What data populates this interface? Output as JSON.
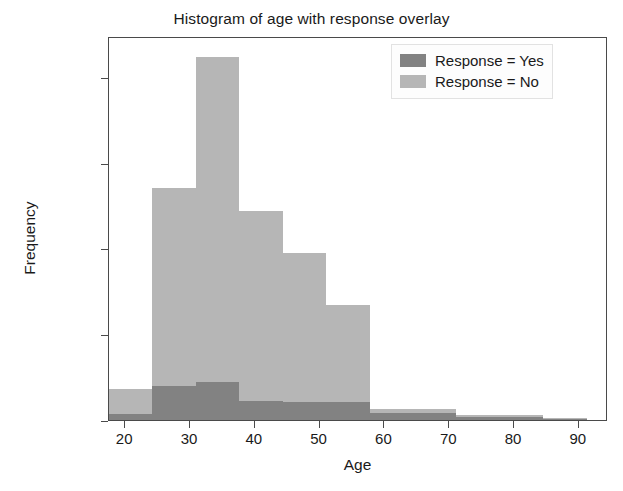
{
  "chart_data": {
    "type": "bar",
    "title": "Histogram of age with response overlay",
    "xlabel": "Age",
    "ylabel": "Frequency",
    "xlim": [
      17.5,
      94.5
    ],
    "ylim": [
      0,
      8950
    ],
    "grid": false,
    "legend_position": "upper right",
    "xticks": [
      20,
      30,
      40,
      50,
      60,
      70,
      80,
      90
    ],
    "yticks": [
      0,
      2000,
      4000,
      6000,
      8000
    ],
    "bin_edges": [
      17.5,
      24.2,
      30.9,
      37.6,
      44.3,
      51.0,
      57.7,
      64.4,
      71.1,
      77.8,
      84.5,
      91.2
    ],
    "series": [
      {
        "name": "Response = No",
        "color": "#b6b6b6",
        "values": [
          720,
          5400,
          8450,
          4880,
          3900,
          2680,
          250,
          250,
          110,
          110,
          40
        ]
      },
      {
        "name": "Response = Yes",
        "color": "#828282",
        "values": [
          150,
          790,
          880,
          450,
          420,
          410,
          170,
          170,
          70,
          70,
          20
        ]
      }
    ],
    "legend": [
      {
        "label": "Response = Yes",
        "color": "#828282"
      },
      {
        "label": "Response = No",
        "color": "#b6b6b6"
      }
    ]
  }
}
